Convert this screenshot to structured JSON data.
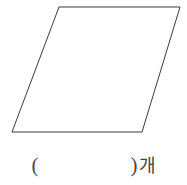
{
  "figure": {
    "name": "parallelogram",
    "shape_type": "parallelogram",
    "stroke_color": "#3a3a3a",
    "fill_color": "#ffffff",
    "points": "59,7 180,7 142,132 12,132",
    "vertices": [
      {
        "label": "top-left",
        "x": 59,
        "y": 7
      },
      {
        "label": "top-right",
        "x": 180,
        "y": 7
      },
      {
        "label": "bottom-right",
        "x": 142,
        "y": 132
      },
      {
        "label": "bottom-left",
        "x": 12,
        "y": 132
      }
    ]
  },
  "answer": {
    "open_paren": "(",
    "close_paren": ")",
    "unit": "개",
    "full_text": "( )개"
  },
  "page": {
    "background_color": "#ffffff",
    "width": 187,
    "height": 185
  }
}
